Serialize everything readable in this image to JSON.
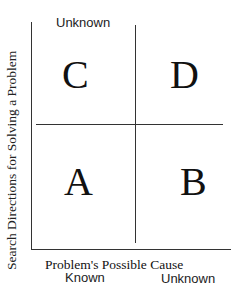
{
  "diagram": {
    "y_axis_label": "Search Directions for Solving a Problem",
    "y_top_label": "Unknown",
    "x_axis_label": "Problem's Possible Cause",
    "x_left_label": "Known",
    "x_right_label": "Unknown",
    "quadrants": {
      "top_left": "C",
      "top_right": "D",
      "bottom_left": "A",
      "bottom_right": "B"
    }
  }
}
